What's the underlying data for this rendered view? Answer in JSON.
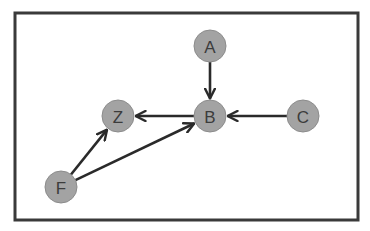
{
  "diagram": {
    "type": "directed-graph",
    "colors": {
      "frame": "#3a3a3a",
      "edge": "#2a2a2a",
      "node_fill": "#a3a3a3",
      "node_label": "#3c3c3c"
    },
    "nodes": [
      {
        "id": "A",
        "label": "A",
        "x": 210,
        "y": 46
      },
      {
        "id": "B",
        "label": "B",
        "x": 210,
        "y": 116
      },
      {
        "id": "C",
        "label": "C",
        "x": 303,
        "y": 116
      },
      {
        "id": "Z",
        "label": "Z",
        "x": 118,
        "y": 116
      },
      {
        "id": "F",
        "label": "F",
        "x": 61,
        "y": 187
      }
    ],
    "edges": [
      {
        "from": "A",
        "to": "B"
      },
      {
        "from": "C",
        "to": "B"
      },
      {
        "from": "B",
        "to": "Z"
      },
      {
        "from": "F",
        "to": "Z"
      },
      {
        "from": "F",
        "to": "B"
      }
    ]
  }
}
